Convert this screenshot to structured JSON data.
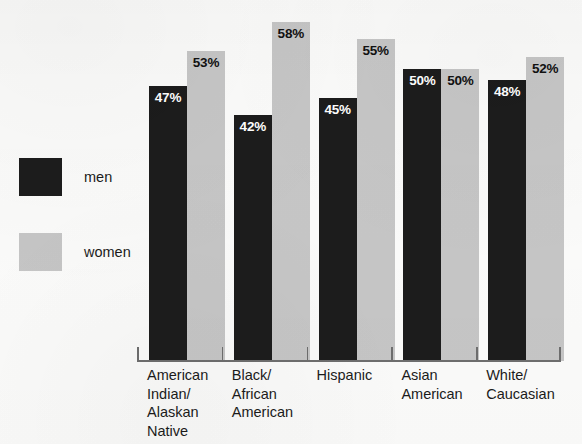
{
  "legend": {
    "items": [
      {
        "label": "men",
        "color": "#1c1c1c",
        "key": "men"
      },
      {
        "label": "women",
        "color": "#c6c6c6",
        "key": "women"
      }
    ]
  },
  "chart_data": {
    "type": "bar",
    "title": "",
    "subtitle": "",
    "xlabel": "",
    "ylabel": "",
    "ylim": [
      0,
      60
    ],
    "grid": false,
    "legend_position": "left",
    "value_label_suffix": "%",
    "categories": [
      "American\nIndian/\nAlaskan\nNative",
      "Black/\nAfrican\nAmerican",
      "Hispanic",
      "Asian\nAmerican",
      "White/\nCaucasian"
    ],
    "series": [
      {
        "name": "men",
        "color": "#1c1c1c",
        "values": [
          47,
          42,
          45,
          50,
          48
        ],
        "value_labels": [
          "47%",
          "42%",
          "45%",
          "50%",
          "48%"
        ]
      },
      {
        "name": "women",
        "color": "#c6c6c6",
        "values": [
          53,
          58,
          55,
          50,
          52
        ],
        "value_labels": [
          "53%",
          "58%",
          "55%",
          "50%",
          "52%"
        ]
      }
    ]
  },
  "axis": {
    "tick_count": 6
  }
}
